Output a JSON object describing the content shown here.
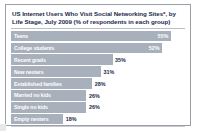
{
  "card": {
    "title": "US Internet Users Who Visit Social Networking Sites*, by Life Stage, July 2009 (% of respondents in each group)"
  },
  "colors": {
    "bar": "#a8b0bc",
    "title_text": "#1b2a4a",
    "bar_label_text": "#ffffff",
    "card_border": "#9aa0a6",
    "background": "#ffffff"
  },
  "chart_data": {
    "type": "bar",
    "orientation": "horizontal",
    "title": "US Internet Users Who Visit Social Networking Sites*, by Life Stage, July 2009 (% of respondents in each group)",
    "xlabel": "",
    "ylabel": "",
    "xlim": [
      0,
      60
    ],
    "grid": false,
    "legend": false,
    "unit": "%",
    "categories": [
      "Teens",
      "College students",
      "Recent grads",
      "New nesters",
      "Established families",
      "Married no kids",
      "Single no kids",
      "Empty nesters"
    ],
    "values": [
      55,
      52,
      35,
      31,
      28,
      26,
      26,
      18
    ],
    "value_labels": [
      "55%",
      "52%",
      "35%",
      "31%",
      "28%",
      "26%",
      "26%",
      "18%"
    ],
    "bars": [
      {
        "label": "Teens",
        "value": 55,
        "value_label": "55%",
        "label_inside": true,
        "value_inside": true
      },
      {
        "label": "College students",
        "value": 52,
        "value_label": "52%",
        "label_inside": true,
        "value_inside": true
      },
      {
        "label": "Recent grads",
        "value": 35,
        "value_label": "35%",
        "label_inside": true,
        "value_inside": false
      },
      {
        "label": "New nesters",
        "value": 31,
        "value_label": "31%",
        "label_inside": true,
        "value_inside": false
      },
      {
        "label": "Established families",
        "value": 28,
        "value_label": "28%",
        "label_inside": true,
        "value_inside": false
      },
      {
        "label": "Married no kids",
        "value": 26,
        "value_label": "26%",
        "label_inside": true,
        "value_inside": false
      },
      {
        "label": "Single no kids",
        "value": 26,
        "value_label": "26%",
        "label_inside": true,
        "value_inside": false
      },
      {
        "label": "Empty nesters",
        "value": 18,
        "value_label": "18%",
        "label_inside": true,
        "value_inside": false
      }
    ]
  }
}
